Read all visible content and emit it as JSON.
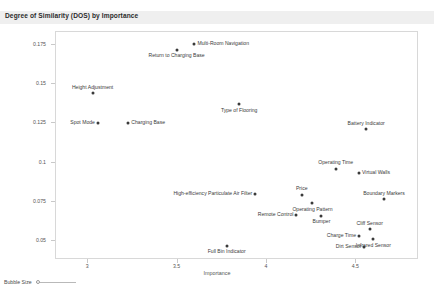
{
  "header": {
    "title": "Degree of Similarity (DOS) by Importance"
  },
  "legend": {
    "bubble_size_label": "Bubble Size"
  },
  "chart_data": {
    "type": "scatter",
    "title": "Degree of Similarity (DOS) by Importance",
    "xlabel": "Importance",
    "ylabel": "Differentiation",
    "xlim": [
      2.82,
      4.85
    ],
    "ylim": [
      0.038,
      0.183
    ],
    "xticks": [
      3,
      3.5,
      4,
      4.5
    ],
    "xtick_labels": [
      "3",
      "3.5",
      "4",
      "4.5"
    ],
    "yticks": [
      0.05,
      0.075,
      0.1,
      0.125,
      0.15,
      0.175
    ],
    "ytick_labels": [
      "0.05",
      "0.075",
      "0.1",
      "0.125",
      "0.15",
      "0.175"
    ],
    "grid": false,
    "legend_position": "bottom-left",
    "point_color": "#3a3a3a",
    "points": [
      {
        "label": "Multi-Room Navigation",
        "x": 3.6,
        "y": 0.1748,
        "label_pos": "right"
      },
      {
        "label": "Return to Charging Base",
        "x": 3.5,
        "y": 0.171,
        "label_pos": "below"
      },
      {
        "label": "Height Adjustment",
        "x": 3.03,
        "y": 0.1435,
        "label_pos": "above"
      },
      {
        "label": "Type of Flooring",
        "x": 3.85,
        "y": 0.1365,
        "label_pos": "below"
      },
      {
        "label": "Battery Indicator",
        "x": 4.56,
        "y": 0.1205,
        "label_pos": "above"
      },
      {
        "label": "Spot Mode",
        "x": 3.06,
        "y": 0.1245,
        "label_pos": "left"
      },
      {
        "label": "Charging Base",
        "x": 3.23,
        "y": 0.1243,
        "label_pos": "right"
      },
      {
        "label": "Operating Time",
        "x": 4.39,
        "y": 0.0955,
        "label_pos": "above"
      },
      {
        "label": "Virtual Walls",
        "x": 4.52,
        "y": 0.093,
        "label_pos": "right"
      },
      {
        "label": "High-efficiency Particulate Air Filter",
        "x": 3.94,
        "y": 0.0795,
        "label_pos": "left"
      },
      {
        "label": "Price",
        "x": 4.2,
        "y": 0.079,
        "label_pos": "above"
      },
      {
        "label": "Boundary Markers",
        "x": 4.66,
        "y": 0.076,
        "label_pos": "above"
      },
      {
        "label": "Operating Pattern",
        "x": 4.26,
        "y": 0.0735,
        "label_pos": "below"
      },
      {
        "label": "Remote Control",
        "x": 4.17,
        "y": 0.066,
        "label_pos": "left"
      },
      {
        "label": "Bumper",
        "x": 4.31,
        "y": 0.0655,
        "label_pos": "below"
      },
      {
        "label": "Cliff Sensor",
        "x": 4.58,
        "y": 0.057,
        "label_pos": "above"
      },
      {
        "label": "Charge Time",
        "x": 4.52,
        "y": 0.0528,
        "label_pos": "left"
      },
      {
        "label": "Infrared Sensor",
        "x": 4.6,
        "y": 0.0505,
        "label_pos": "below"
      },
      {
        "label": "Dirt Sensor",
        "x": 4.55,
        "y": 0.0455,
        "label_pos": "left"
      },
      {
        "label": "Full Bin Indicator",
        "x": 3.78,
        "y": 0.0465,
        "label_pos": "below"
      }
    ]
  }
}
